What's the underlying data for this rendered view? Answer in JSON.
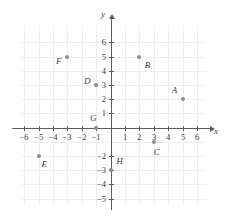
{
  "chart_data": {
    "type": "scatter",
    "title": "",
    "xlabel": "x",
    "ylabel": "y",
    "xlim": [
      -7,
      7
    ],
    "ylim": [
      -6,
      7
    ],
    "grid": true,
    "legend": "none",
    "xticks": [
      "-6",
      "-5",
      "-4",
      "-3",
      "-2",
      "-1",
      "1",
      "2",
      "3",
      "4",
      "5",
      "6"
    ],
    "xtick_values": [
      -6,
      -5,
      -4,
      -3,
      -2,
      -1,
      1,
      2,
      3,
      4,
      5,
      6
    ],
    "yticks": [
      "6",
      "5",
      "4",
      "3",
      "2",
      "1",
      "-2",
      "-3",
      "-4",
      "-5"
    ],
    "ytick_values": [
      6,
      5,
      4,
      3,
      2,
      1,
      -2,
      -3,
      -4,
      -5
    ],
    "points": [
      {
        "label": "A",
        "x": 5,
        "y": 2,
        "lx": -0.55,
        "ly": 0.62
      },
      {
        "label": "B",
        "x": 2,
        "y": 5,
        "lx": 0.55,
        "ly": -0.62
      },
      {
        "label": "C",
        "x": 3,
        "y": -1,
        "lx": 0.22,
        "ly": -0.7
      },
      {
        "label": "D",
        "x": -1,
        "y": 3,
        "lx": -0.62,
        "ly": 0.28
      },
      {
        "label": "E",
        "x": -5,
        "y": -2,
        "lx": 0.4,
        "ly": -0.6
      },
      {
        "label": "F",
        "x": -3,
        "y": 5,
        "lx": -0.6,
        "ly": -0.35
      },
      {
        "label": "G",
        "x": -1,
        "y": 0,
        "lx": -0.2,
        "ly": 0.65
      },
      {
        "label": "H",
        "x": 0,
        "y": -3,
        "lx": 0.62,
        "ly": 0.62
      }
    ]
  },
  "colors": {
    "grid": "#ededf0",
    "axis": "#5b5b62",
    "point": "#8b8b95",
    "text": "#3a3a40",
    "background": "#ffffff"
  }
}
